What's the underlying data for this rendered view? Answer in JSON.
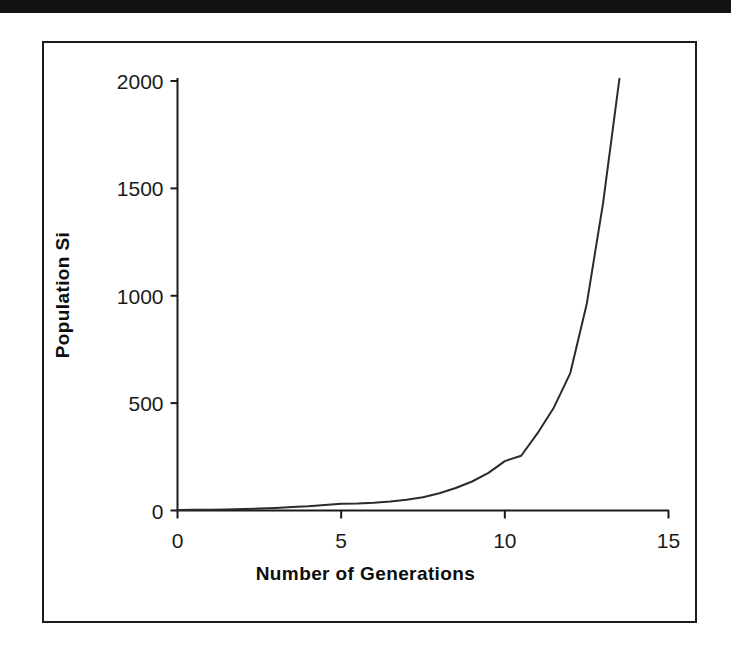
{
  "page": {
    "background_color": "#ffffff",
    "scan_bar_color": "#131313",
    "frame_color": "#1b1b1b"
  },
  "chart_data": {
    "type": "line",
    "title": "",
    "subtitle": "",
    "xlabel": "Number of Generations",
    "ylabel": "Population Si",
    "xlim": [
      0,
      15
    ],
    "ylim": [
      0,
      2000
    ],
    "xticks": [
      0,
      5,
      10,
      15
    ],
    "xtick_labels": [
      "0",
      "5",
      "10",
      "15"
    ],
    "yticks": [
      0,
      500,
      1000,
      1500,
      2000
    ],
    "ytick_labels": [
      "0",
      "500",
      "1000",
      "1500",
      "2000"
    ],
    "grid": false,
    "legend": false,
    "legend_position": "none",
    "line_color": "#2b2b2b",
    "line_width": 2,
    "series": [
      {
        "name": "Population Si",
        "x": [
          0,
          0.5,
          1,
          1.5,
          2,
          2.5,
          3,
          3.5,
          4,
          4.5,
          5,
          5.5,
          6,
          6.5,
          7,
          7.5,
          8,
          8.5,
          9,
          9.5,
          10,
          10.5,
          11,
          11.5,
          12,
          12.5,
          13,
          13.5
        ],
        "values": [
          2,
          3,
          4,
          5,
          7,
          9,
          12,
          16,
          20,
          26,
          32,
          33,
          36,
          42,
          50,
          62,
          80,
          105,
          135,
          175,
          230,
          255,
          360,
          480,
          640,
          960,
          1430,
          2010
        ]
      }
    ],
    "annotations": []
  },
  "axis_titles": {
    "x": "Number of Generations",
    "y": "Population Si"
  }
}
